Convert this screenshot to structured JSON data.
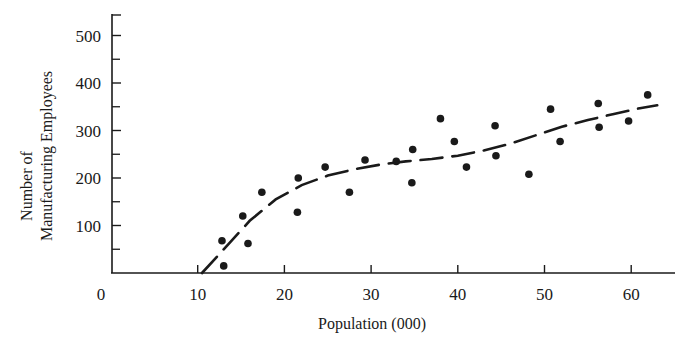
{
  "chart_data": {
    "type": "scatter",
    "title": "",
    "xlabel": "Population (000)",
    "ylabel_lines": [
      "Number of",
      "Manufacturing Employees"
    ],
    "ylabel": "Number of Manufacturing Employees",
    "xlim": [
      0,
      64
    ],
    "ylim": [
      0,
      520
    ],
    "x_ticks": [
      0,
      10,
      20,
      30,
      40,
      50,
      60
    ],
    "x_tick_labels": [
      "0",
      "10",
      "20",
      "30",
      "40",
      "50",
      "60"
    ],
    "y_ticks": [
      100,
      200,
      300,
      400,
      500
    ],
    "y_tick_labels": [
      "100",
      "200",
      "300",
      "400",
      "500"
    ],
    "y_minor_ticks": [
      50,
      150,
      250,
      350,
      450
    ],
    "grid": false,
    "legend": null,
    "series": [
      {
        "name": "observations",
        "marker": "filled-circle",
        "points": [
          [
            12.8,
            68
          ],
          [
            13.0,
            15
          ],
          [
            15.2,
            120
          ],
          [
            15.8,
            62
          ],
          [
            17.4,
            170
          ],
          [
            21.6,
            200
          ],
          [
            21.5,
            128
          ],
          [
            24.7,
            223
          ],
          [
            27.5,
            170
          ],
          [
            29.3,
            238
          ],
          [
            32.9,
            235
          ],
          [
            34.8,
            260
          ],
          [
            34.7,
            190
          ],
          [
            38.0,
            325
          ],
          [
            39.6,
            277
          ],
          [
            41.0,
            223
          ],
          [
            44.3,
            310
          ],
          [
            44.4,
            247
          ],
          [
            48.2,
            208
          ],
          [
            50.7,
            345
          ],
          [
            51.8,
            277
          ],
          [
            56.2,
            357
          ],
          [
            56.3,
            307
          ],
          [
            59.7,
            320
          ],
          [
            61.9,
            375
          ]
        ]
      },
      {
        "name": "fitted trend",
        "style": "dashed-line",
        "points": [
          [
            10.5,
            0
          ],
          [
            13,
            50
          ],
          [
            16,
            110
          ],
          [
            19,
            155
          ],
          [
            22,
            185
          ],
          [
            25,
            205
          ],
          [
            28,
            218
          ],
          [
            31,
            228
          ],
          [
            34,
            235
          ],
          [
            37,
            240
          ],
          [
            40,
            247
          ],
          [
            43,
            258
          ],
          [
            46,
            272
          ],
          [
            49,
            290
          ],
          [
            52,
            308
          ],
          [
            55,
            322
          ],
          [
            58,
            335
          ],
          [
            61,
            347
          ],
          [
            63,
            353
          ]
        ]
      }
    ]
  },
  "colors": {
    "ink": "#1a1a1a",
    "background": "#ffffff"
  }
}
